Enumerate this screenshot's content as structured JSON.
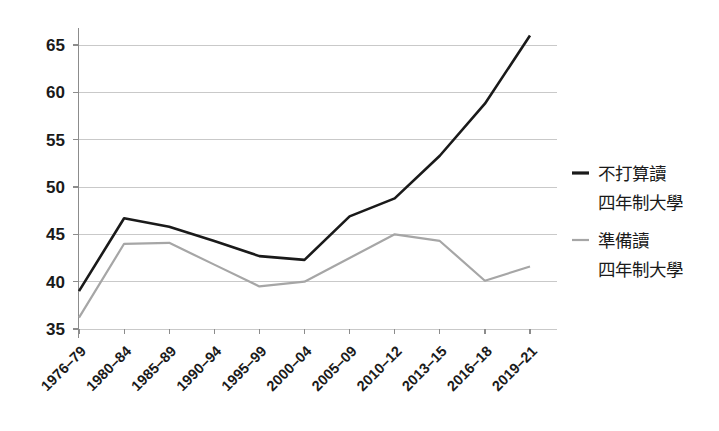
{
  "chart_data": {
    "type": "line",
    "title": "",
    "subtitle": "",
    "xlabel": "",
    "ylabel": "",
    "categories": [
      "1976–79",
      "1980–84",
      "1985–89",
      "1990–94",
      "1995–99",
      "2000–04",
      "2005–09",
      "2010–12",
      "2013–15",
      "2016–18",
      "2019–21"
    ],
    "ylim": [
      35,
      67
    ],
    "yticks": [
      35,
      40,
      45,
      50,
      55,
      60,
      65
    ],
    "ytick_labels": [
      "35",
      "40",
      "45",
      "50",
      "55",
      "60",
      "65"
    ],
    "grid": "horizontal",
    "legend_position": "right",
    "series": [
      {
        "name": "不打算讀四年制大學",
        "name_line1": "不打算讀",
        "name_line2": "四年制大學",
        "color": "#1a1a1a",
        "width": 2.6,
        "values": [
          39.0,
          46.7,
          45.8,
          44.3,
          42.7,
          42.3,
          46.9,
          48.8,
          53.3,
          58.8,
          66.0
        ]
      },
      {
        "name": "準備讀四年制大學",
        "name_line1": "準備讀",
        "name_line2": "四年制大學",
        "color": "#a6a6a6",
        "width": 2.2,
        "values": [
          36.2,
          44.0,
          44.1,
          41.8,
          39.5,
          40.0,
          42.5,
          45.0,
          44.3,
          40.1,
          41.6
        ]
      }
    ]
  },
  "legend": {
    "entries": [
      {
        "line1": "不打算讀",
        "line2": "四年制大學",
        "color": "#1a1a1a"
      },
      {
        "line1": "準備讀",
        "line2": "四年制大學",
        "color": "#a6a6a6"
      }
    ]
  },
  "axes": {
    "y_tick_0": "35",
    "y_tick_1": "40",
    "y_tick_2": "45",
    "y_tick_3": "50",
    "y_tick_4": "55",
    "y_tick_5": "60",
    "y_tick_6": "65",
    "x_tick_0": "1976–79",
    "x_tick_1": "1980–84",
    "x_tick_2": "1985–89",
    "x_tick_3": "1990–94",
    "x_tick_4": "1995–99",
    "x_tick_5": "2000–04",
    "x_tick_6": "2005–09",
    "x_tick_7": "2010–12",
    "x_tick_8": "2013–15",
    "x_tick_9": "2016–18",
    "x_tick_10": "2019–21"
  }
}
